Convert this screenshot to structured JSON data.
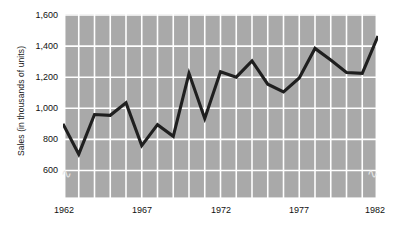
{
  "chart_data": {
    "type": "line",
    "title": "",
    "subtitle": "",
    "xlabel": "",
    "ylabel": "Sales (in thousands of units)",
    "x": [
      1962,
      1963,
      1964,
      1965,
      1966,
      1967,
      1968,
      1969,
      1970,
      1971,
      1972,
      1973,
      1974,
      1975,
      1976,
      1977,
      1978,
      1979,
      1980,
      1981,
      1982
    ],
    "values": [
      900,
      705,
      960,
      955,
      1035,
      760,
      895,
      820,
      1225,
      935,
      1235,
      1200,
      1305,
      1155,
      1105,
      1195,
      1385,
      1310,
      1230,
      1225,
      1465
    ],
    "categories": [
      "1962",
      "1963",
      "1964",
      "1965",
      "1966",
      "1967",
      "1968",
      "1969",
      "1970",
      "1971",
      "1972",
      "1973",
      "1974",
      "1975",
      "1976",
      "1977",
      "1978",
      "1979",
      "1980",
      "1981",
      "1982"
    ],
    "series": [
      {
        "name": "Sales",
        "values": [
          900,
          705,
          960,
          955,
          1035,
          760,
          895,
          820,
          1225,
          935,
          1235,
          1200,
          1305,
          1155,
          1105,
          1195,
          1385,
          1310,
          1230,
          1225,
          1465
        ]
      }
    ],
    "ylim": [
      500,
      1600
    ],
    "xlim": [
      1962,
      1982
    ],
    "y_ticks": [
      600,
      800,
      1000,
      1200,
      1400,
      1600
    ],
    "y_tick_labels": [
      "600",
      "800",
      "1,000",
      "1,200",
      "1,400",
      "1,600"
    ],
    "x_ticks": [
      1962,
      1967,
      1972,
      1977,
      1982
    ],
    "x_tick_labels": [
      "1962",
      "1967",
      "1972",
      "1977",
      "1982"
    ],
    "grid": true,
    "grid_color": "#ffffff",
    "plot_background": "#a9a9a9",
    "line_color": "#1a1a1a",
    "line_width": 3,
    "legend": false,
    "legend_position": "none",
    "y_axis_break": true,
    "y_axis_break_symbol": "zigzag"
  },
  "axis": {
    "y_title": "Sales (in thousands of units)"
  }
}
